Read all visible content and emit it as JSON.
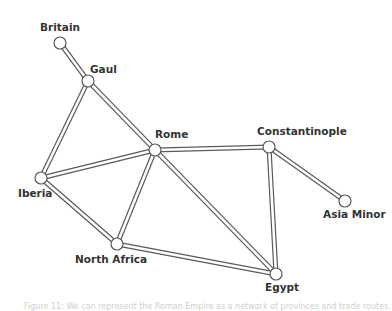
{
  "diagram": {
    "type": "network-graph",
    "edge_style": {
      "outer_color": "#5a5a5a",
      "inner_color": "#ffffff",
      "outer_width": 5,
      "inner_width": 2.6
    },
    "node_style": {
      "fill": "#ffffff",
      "stroke": "#5a5a5a",
      "radius": 6
    },
    "nodes": [
      {
        "id": "britain",
        "label": "Britain",
        "x": 60,
        "y": 43,
        "lx": 60,
        "ly": 31,
        "anchor": "middle"
      },
      {
        "id": "gaul",
        "label": "Gaul",
        "x": 88,
        "y": 81,
        "lx": 90,
        "ly": 73,
        "anchor": "start"
      },
      {
        "id": "rome",
        "label": "Rome",
        "x": 155,
        "y": 150,
        "lx": 155,
        "ly": 138,
        "anchor": "start"
      },
      {
        "id": "constantinople",
        "label": "Constantinople",
        "x": 269,
        "y": 147,
        "lx": 257,
        "ly": 135,
        "anchor": "start"
      },
      {
        "id": "asia_minor",
        "label": "Asia Minor",
        "x": 345,
        "y": 201,
        "lx": 323,
        "ly": 218,
        "anchor": "start"
      },
      {
        "id": "iberia",
        "label": "Iberia",
        "x": 41,
        "y": 178,
        "lx": 18,
        "ly": 197,
        "anchor": "start"
      },
      {
        "id": "north_africa",
        "label": "North Africa",
        "x": 117,
        "y": 244,
        "lx": 75,
        "ly": 263,
        "anchor": "start"
      },
      {
        "id": "egypt",
        "label": "Egypt",
        "x": 276,
        "y": 274,
        "lx": 265,
        "ly": 291,
        "anchor": "start"
      }
    ],
    "edges": [
      {
        "from": "britain",
        "to": "gaul"
      },
      {
        "from": "gaul",
        "to": "rome"
      },
      {
        "from": "gaul",
        "to": "iberia"
      },
      {
        "from": "rome",
        "to": "iberia"
      },
      {
        "from": "rome",
        "to": "north_africa"
      },
      {
        "from": "rome",
        "to": "egypt"
      },
      {
        "from": "rome",
        "to": "constantinople"
      },
      {
        "from": "iberia",
        "to": "north_africa"
      },
      {
        "from": "north_africa",
        "to": "egypt"
      },
      {
        "from": "constantinople",
        "to": "egypt"
      },
      {
        "from": "constantinople",
        "to": "asia_minor"
      }
    ]
  },
  "caption": {
    "text": "Figure 11: We can represent the Roman Empire as a network of provinces and trade routes."
  }
}
